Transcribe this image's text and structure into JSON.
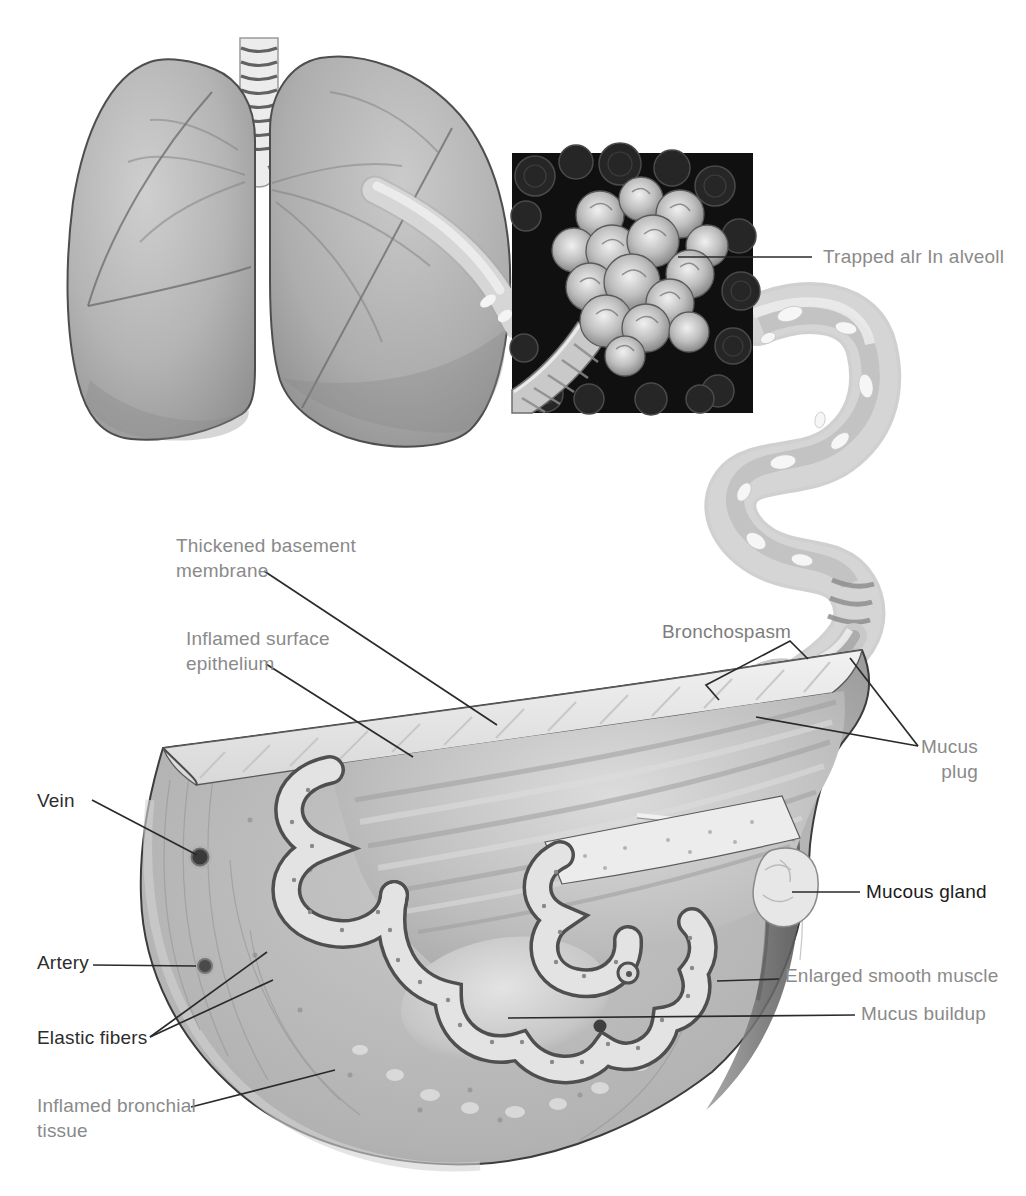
{
  "labels": {
    "trapped_air": {
      "text": "Trapped alr In alveoll"
    },
    "thickened_membrane": {
      "text": "Thickened basement\nmembrane"
    },
    "inflamed_epithelium": {
      "text": "Inflamed surface\nepithelium"
    },
    "bronchospasm": {
      "text": "Bronchospasm"
    },
    "mucus_plug": {
      "text": "Mucus\nplug"
    },
    "vein": {
      "text": "Vein"
    },
    "artery": {
      "text": "Artery"
    },
    "elastic_fibers": {
      "text": "Elastic fibers"
    },
    "inflamed_tissue": {
      "text": "Inflamed bronchial\ntissue"
    },
    "mucous_gland": {
      "text": "Mucous gland"
    },
    "enlarged_muscle": {
      "text": "Enlarged smooth muscle"
    },
    "mucus_buildup": {
      "text": "Mucus buildup"
    }
  },
  "colors": {
    "label_gray": "#8a8a8a",
    "label_dark": "#2d2d2d",
    "label_black": "#1b1b1b",
    "leader_line": "#2a2a2a",
    "inset_background": "#101010",
    "paper": "#ffffff"
  }
}
